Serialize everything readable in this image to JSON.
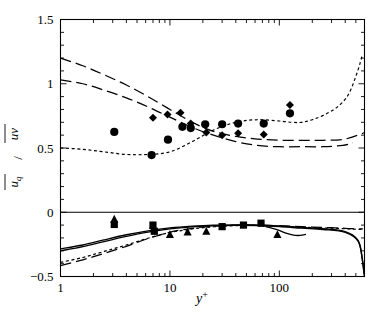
{
  "chart_data": {
    "type": "line",
    "title": "",
    "xlabel": "y+",
    "ylabel": "u_q / uv",
    "xscale": "log",
    "yscale": "linear",
    "xlim": [
      1,
      600
    ],
    "ylim": [
      -0.5,
      1.5
    ],
    "grid": false,
    "legend": "none",
    "x_tick_labels": [
      "1",
      "10",
      "100"
    ],
    "x_tick_values": [
      1,
      10,
      100
    ],
    "y_tick_labels": [
      "-0.5",
      "0",
      "0.5",
      "1",
      "1.5"
    ],
    "y_tick_values": [
      -0.5,
      0,
      0.5,
      1,
      1.5
    ],
    "y_minor_ticks": [
      -0.4,
      -0.3,
      -0.2,
      -0.1,
      0.1,
      0.2,
      0.3,
      0.4,
      0.6,
      0.7,
      0.8,
      0.9,
      1.1,
      1.2,
      1.3,
      1.4
    ],
    "annotations": [
      {
        "text": "zero-reference-line",
        "y": 0
      }
    ],
    "series": [
      {
        "name": "upper-long-dash-a",
        "style": "long-dash",
        "panel": "upper",
        "x": [
          1.0,
          1.6,
          2.5,
          4.0,
          6.3,
          10.0,
          16.0,
          25.0,
          40.0,
          63.0,
          100.0,
          160.0,
          250.0,
          400.0,
          600.0
        ],
        "y": [
          1.2,
          1.14,
          1.07,
          0.99,
          0.9,
          0.8,
          0.7,
          0.63,
          0.59,
          0.57,
          0.56,
          0.56,
          0.56,
          0.57,
          0.62
        ]
      },
      {
        "name": "upper-long-dash-b",
        "style": "long-dash",
        "panel": "upper",
        "x": [
          1.0,
          1.6,
          2.5,
          4.0,
          6.3,
          10.0,
          16.0,
          25.0,
          40.0,
          63.0,
          100.0,
          160.0,
          250.0,
          380.0,
          470.0
        ],
        "y": [
          1.03,
          1.0,
          0.95,
          0.89,
          0.82,
          0.74,
          0.66,
          0.6,
          0.55,
          0.52,
          0.51,
          0.51,
          0.51,
          0.52,
          0.54
        ]
      },
      {
        "name": "upper-short-dash",
        "style": "short-dash",
        "panel": "upper",
        "x": [
          1.0,
          1.6,
          2.5,
          4.0,
          6.3,
          10.0,
          16.0,
          25.0,
          40.0,
          63.0,
          100.0,
          130.0,
          160.0,
          200.0,
          260.0,
          340.0,
          430.0,
          520.0,
          570.0
        ],
        "y": [
          0.5,
          0.49,
          0.47,
          0.45,
          0.45,
          0.47,
          0.55,
          0.64,
          0.7,
          0.72,
          0.71,
          0.7,
          0.7,
          0.72,
          0.76,
          0.82,
          0.92,
          1.1,
          1.22
        ]
      },
      {
        "name": "lower-solid-a",
        "style": "solid",
        "panel": "lower",
        "x": [
          1.0,
          1.6,
          2.5,
          4.0,
          6.3,
          10.0,
          16.0,
          25.0,
          40.0,
          63.0,
          100.0,
          160.0,
          250.0,
          400.0,
          520.0,
          570.0,
          595.0
        ],
        "y": [
          -0.285,
          -0.255,
          -0.215,
          -0.175,
          -0.145,
          -0.122,
          -0.108,
          -0.1,
          -0.098,
          -0.1,
          -0.107,
          -0.118,
          -0.128,
          -0.15,
          -0.215,
          -0.35,
          -0.48
        ]
      },
      {
        "name": "lower-solid-b",
        "style": "solid",
        "panel": "lower",
        "x": [
          1.0,
          1.6,
          2.5,
          4.0,
          6.3,
          10.0,
          16.0,
          25.0,
          40.0,
          63.0,
          100.0,
          160.0,
          250.0,
          400.0,
          530.0,
          575.0,
          598.0
        ],
        "y": [
          -0.3,
          -0.268,
          -0.228,
          -0.188,
          -0.155,
          -0.13,
          -0.114,
          -0.105,
          -0.102,
          -0.104,
          -0.112,
          -0.124,
          -0.134,
          -0.156,
          -0.23,
          -0.38,
          -0.5
        ]
      },
      {
        "name": "lower-long-dash",
        "style": "long-dash",
        "panel": "lower",
        "x": [
          1.0,
          1.6,
          2.5,
          4.0,
          6.3,
          10.0,
          16.0,
          25.0,
          40.0,
          63.0,
          100.0,
          160.0,
          250.0,
          400.0,
          520.0,
          580.0
        ],
        "y": [
          -0.415,
          -0.37,
          -0.32,
          -0.265,
          -0.205,
          -0.155,
          -0.125,
          -0.108,
          -0.1,
          -0.1,
          -0.105,
          -0.112,
          -0.118,
          -0.125,
          -0.13,
          -0.13
        ]
      },
      {
        "name": "lower-short-dash",
        "style": "short-dash",
        "panel": "lower",
        "x": [
          1.0,
          1.6,
          2.5,
          4.0,
          6.3,
          10.0,
          16.0,
          25.0,
          40.0,
          63.0,
          100.0,
          160.0,
          250.0,
          400.0,
          520.0,
          580.0
        ],
        "y": [
          -0.39,
          -0.352,
          -0.305,
          -0.255,
          -0.202,
          -0.158,
          -0.13,
          -0.113,
          -0.104,
          -0.103,
          -0.108,
          -0.116,
          -0.122,
          -0.128,
          -0.133,
          -0.134
        ]
      },
      {
        "name": "lower-short-solid-dip",
        "style": "solid",
        "panel": "lower",
        "x": [
          75.0,
          95.0,
          115.0,
          135.0,
          155.0,
          175.0
        ],
        "y": [
          -0.112,
          -0.135,
          -0.162,
          -0.178,
          -0.18,
          -0.172
        ]
      },
      {
        "name": "circles-upper",
        "style": "marker",
        "marker": "circle",
        "panel": "upper",
        "x": [
          3.1,
          6.8,
          9.6,
          13.0,
          15.5,
          21.0,
          30.0,
          42.0,
          72.0,
          125.0
        ],
        "y": [
          0.625,
          0.445,
          0.565,
          0.665,
          0.655,
          0.685,
          0.685,
          0.69,
          0.69,
          0.77
        ]
      },
      {
        "name": "diamonds-upper",
        "style": "marker",
        "marker": "diamond",
        "panel": "upper",
        "x": [
          7.0,
          9.5,
          12.5,
          15.5,
          21.5,
          30.0,
          42.0,
          72.0,
          125.0
        ],
        "y": [
          0.735,
          0.76,
          0.775,
          0.69,
          0.62,
          0.6,
          0.615,
          0.605,
          0.835
        ]
      },
      {
        "name": "triangles-lower",
        "style": "marker",
        "marker": "triangle",
        "panel": "lower",
        "x": [
          3.1,
          7.0,
          10.0,
          14.5,
          21.5,
          96.0
        ],
        "y": [
          -0.055,
          -0.105,
          -0.175,
          -0.155,
          -0.15,
          -0.175
        ]
      },
      {
        "name": "squares-lower",
        "style": "marker",
        "marker": "square",
        "panel": "lower",
        "x": [
          3.1,
          7.0,
          7.2,
          30.0,
          47.0,
          68.0
        ],
        "y": [
          -0.095,
          -0.1,
          -0.148,
          -0.112,
          -0.1,
          -0.085
        ]
      }
    ]
  },
  "axes": {
    "x_title": "y",
    "x_title_sup": "+",
    "y_title_num": "u",
    "y_title_num_sub": "q",
    "y_title_den": "uv",
    "y_title_slash": "/"
  }
}
